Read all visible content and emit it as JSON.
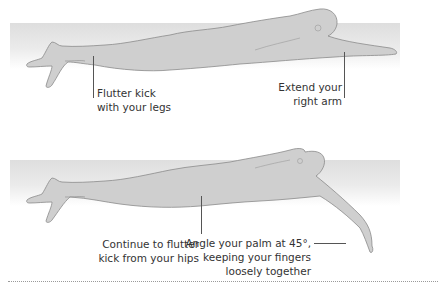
{
  "figures": [
    {
      "name": "swimmer-arm-extended",
      "callouts": [
        {
          "id": "legs",
          "lines": [
            "Flutter kick",
            "with your legs"
          ]
        },
        {
          "id": "arm",
          "lines": [
            "Extend your",
            "right arm"
          ]
        }
      ]
    },
    {
      "name": "swimmer-arm-catch",
      "callouts": [
        {
          "id": "hips",
          "lines": [
            "Continue to flutter",
            "kick from your hips"
          ]
        },
        {
          "id": "palm",
          "lines": [
            "Angle your palm at 45°,",
            "keeping your fingers",
            "loosely together"
          ]
        }
      ]
    }
  ],
  "colors": {
    "water_band": "#e4e4e4",
    "body_fill": "#d0d0d0",
    "body_stroke": "#8a8a8a",
    "text": "#333333",
    "divider": "#9a9a9a"
  }
}
